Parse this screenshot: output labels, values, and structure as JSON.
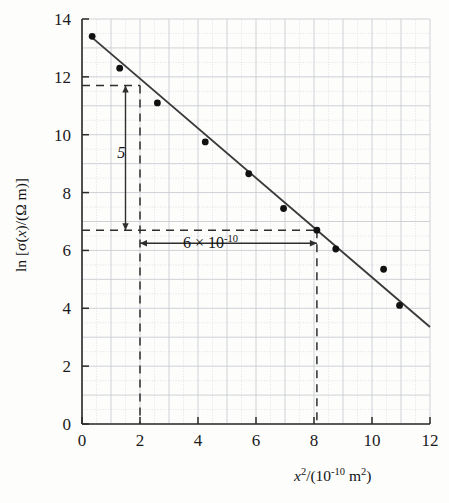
{
  "chart_data": {
    "type": "scatter",
    "title": "",
    "xlabel": "x²/(10⁻¹⁰ m²)",
    "ylabel": "ln [σ(x)/(Ω m)]",
    "xlabel_parts": {
      "var": "x",
      "var_exp": "2",
      "unit_prefix": "/(10",
      "unit_exp": "-10",
      "unit_suffix": " m",
      "unit_sq": "2",
      "unit_close": ")"
    },
    "ylabel_parts": {
      "ln": "ln [",
      "sigma": "σ(",
      "x": "x",
      "close_paren": ")/(",
      "omega": "Ω m)]"
    },
    "xlim": [
      0,
      12
    ],
    "ylim": [
      0,
      14
    ],
    "xticks": [
      0,
      2,
      4,
      6,
      8,
      10,
      12
    ],
    "yticks": [
      0,
      2,
      4,
      6,
      8,
      10,
      12,
      14
    ],
    "xtick_labels": [
      "0",
      "2",
      "4",
      "6",
      "8",
      "10",
      "12"
    ],
    "ytick_labels": [
      "0",
      "2",
      "4",
      "6",
      "8",
      "10",
      "12",
      "14"
    ],
    "grid": true,
    "grid_major_step": 1,
    "grid_minor_step": 0.5,
    "legend": null,
    "points": [
      {
        "x": 0.35,
        "y": 13.4
      },
      {
        "x": 1.3,
        "y": 12.3
      },
      {
        "x": 2.6,
        "y": 11.1
      },
      {
        "x": 4.25,
        "y": 9.75
      },
      {
        "x": 5.75,
        "y": 8.65
      },
      {
        "x": 6.95,
        "y": 7.45
      },
      {
        "x": 8.1,
        "y": 6.7
      },
      {
        "x": 8.75,
        "y": 6.05
      },
      {
        "x": 10.4,
        "y": 5.35
      },
      {
        "x": 10.95,
        "y": 4.1
      }
    ],
    "fit_line": {
      "x0": 0.3,
      "y0": 13.4,
      "x1": 12.0,
      "y1": 3.35,
      "style": "solid"
    },
    "annotations": [
      {
        "name": "rise-label",
        "text": "5",
        "x": 1.35,
        "y": 9.2,
        "kind": "rise"
      },
      {
        "name": "run-label",
        "text": "6 × 10",
        "exponent": "-10",
        "x": 5.0,
        "y": 6.25,
        "kind": "run"
      }
    ],
    "construction": {
      "h_line_upper_y": 11.7,
      "h_line_upper_x_end": 2.0,
      "h_line_lower_y": 6.7,
      "h_line_lower_x_end": 8.1,
      "v_line_left_x": 2.0,
      "v_line_right_x": 8.1,
      "rise_arrow_x": 1.5,
      "rise_arrow_y_top": 11.7,
      "rise_arrow_y_bottom": 6.7,
      "run_arrow_y": 6.25,
      "run_arrow_x_left": 2.0,
      "run_arrow_x_right": 8.1
    },
    "colors": {
      "background": "#fdfdfc",
      "axis": "#2b2b2b",
      "grid_major": "#c6c9cf",
      "grid_minor": "#d6d8dc",
      "point": "#111111",
      "line": "#3a3a3a",
      "dashed": "#2e2e2e",
      "text": "#141414"
    }
  }
}
